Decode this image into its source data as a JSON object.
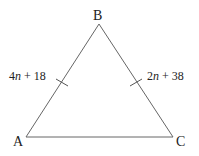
{
  "diagram": {
    "type": "triangle",
    "vertices": {
      "A": {
        "label": "A"
      },
      "B": {
        "label": "B"
      },
      "C": {
        "label": "C"
      }
    },
    "sides": {
      "AB": {
        "label_coef": "4",
        "label_var": "n",
        "label_rest": " + 18",
        "tick": true
      },
      "BC": {
        "label_coef": "2",
        "label_var": "n",
        "label_rest": " + 38",
        "tick": true
      },
      "AC": {
        "tick": false
      }
    },
    "line_color": "#555555"
  }
}
